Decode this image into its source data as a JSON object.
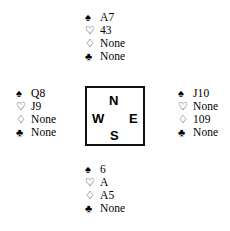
{
  "diagram": {
    "type": "bridge-hand-diagram",
    "background_color": "#ffffff",
    "text_color": "#000000"
  },
  "suits": {
    "spade": {
      "name": "spade-icon",
      "glyph": "♠",
      "style": "filled"
    },
    "heart": {
      "name": "heart-icon",
      "glyph": "♡",
      "style": "outline"
    },
    "diamond": {
      "name": "diamond-icon",
      "glyph": "♢",
      "style": "outline"
    },
    "club": {
      "name": "club-icon",
      "glyph": "♣",
      "style": "filled"
    }
  },
  "compass": {
    "border_color": "#111111",
    "north": "N",
    "west": "W",
    "east": "E",
    "south": "S"
  },
  "hands": {
    "north": {
      "position": "North",
      "spades": "A7",
      "hearts": "43",
      "diamonds": "None",
      "clubs": "None"
    },
    "west": {
      "position": "West",
      "spades": "Q8",
      "hearts": "J9",
      "diamonds": "None",
      "clubs": "None"
    },
    "east": {
      "position": "East",
      "spades": "J10",
      "hearts": "None",
      "diamonds": "109",
      "clubs": "None"
    },
    "south": {
      "position": "South",
      "spades": "6",
      "hearts": "A",
      "diamonds": "A5",
      "clubs": "None"
    }
  }
}
